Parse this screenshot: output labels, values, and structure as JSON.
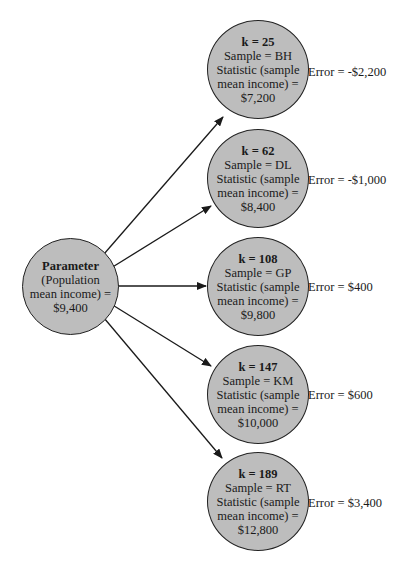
{
  "diagram": {
    "type": "sampling-error-tree",
    "colors": {
      "node_fill": "#bdbdbd",
      "node_stroke": "#222222",
      "edge": "#1a1a1a",
      "background": "#ffffff"
    },
    "parameter": {
      "title": "Parameter",
      "line1": "(Population",
      "line2": "mean income) =",
      "value": "$9,400"
    },
    "samples": [
      {
        "k": "k = 25",
        "sample": "Sample = BH",
        "stat_line1": "Statistic (sample",
        "stat_line2": "mean income) =",
        "value": "$7,200",
        "error": "Error = -$2,200"
      },
      {
        "k": "k = 62",
        "sample": "Sample = DL",
        "stat_line1": "Statistic (sample",
        "stat_line2": "mean income) =",
        "value": "$8,400",
        "error": "Error = -$1,000"
      },
      {
        "k": "k = 108",
        "sample": "Sample = GP",
        "stat_line1": "Statistic (sample",
        "stat_line2": "mean income) =",
        "value": "$9,800",
        "error": "Error = $400"
      },
      {
        "k": "k = 147",
        "sample": "Sample = KM",
        "stat_line1": "Statistic (sample",
        "stat_line2": "mean income) =",
        "value": "$10,000",
        "error": "Error = $600"
      },
      {
        "k": "k = 189",
        "sample": "Sample = RT",
        "stat_line1": "Statistic (sample",
        "stat_line2": "mean income) =",
        "value": "$12,800",
        "error": "Error = $3,400"
      }
    ]
  }
}
